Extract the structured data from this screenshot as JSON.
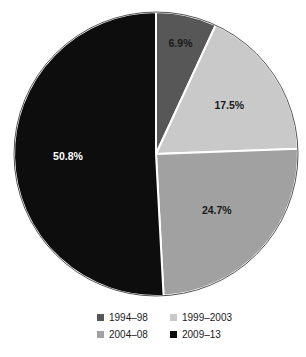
{
  "chart_data": {
    "type": "pie",
    "title": "",
    "subtitle": "",
    "categories": [
      "1994–98",
      "1999–2003",
      "2004–08",
      "2009–13"
    ],
    "values": [
      6.9,
      17.5,
      24.7,
      50.8
    ],
    "value_labels": [
      "6.9%",
      "17.5%",
      "24.7%",
      "50.8%"
    ],
    "units": "percent",
    "colors": [
      "#575757",
      "#c9c9c9",
      "#a1a1a1",
      "#0d0d0d"
    ],
    "label_text_colors": [
      "#1a1a1a",
      "#1a1a1a",
      "#1a1a1a",
      "#ffffff"
    ],
    "start_angle_deg": 0,
    "direction": "clockwise",
    "slice_separator_color": "#ffffff",
    "outline_color": "#555555",
    "legend": {
      "position": "bottom",
      "columns": 2,
      "entries": [
        {
          "label": "1994–98",
          "color": "#575757"
        },
        {
          "label": "1999–2003",
          "color": "#c9c9c9"
        },
        {
          "label": "2004–08",
          "color": "#a1a1a1"
        },
        {
          "label": "2009–13",
          "color": "#0d0d0d"
        }
      ]
    },
    "grid": false,
    "xlabel": "",
    "ylabel": "",
    "annotations": []
  }
}
